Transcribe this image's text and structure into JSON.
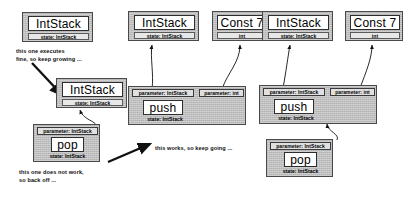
{
  "diagram": {
    "colors": {
      "plate": "#bdbdbd",
      "label_bg": "#ffffff",
      "ink": "#000000"
    },
    "labels": {
      "int_stack": "IntStack",
      "const7": "Const 7",
      "push": "push",
      "pop": "pop",
      "state_intstack": "state: IntStack",
      "int": "int",
      "param_intstack": "parameter: IntStack",
      "param_int": "parameter: int"
    },
    "notes": {
      "note_grow": "this one executes\nfine, so keep growing ...",
      "note_backoff": "this one does not work,\nso back off ...",
      "note_works": "this works, so keep going ..."
    },
    "stages": [
      {
        "id": "stage-1",
        "nodes": [
          {
            "id": "s1-intstack-top",
            "type": "IntStack",
            "state": "state: IntStack"
          },
          {
            "id": "s1-intstack-mid",
            "type": "IntStack",
            "state": "state: IntStack"
          },
          {
            "id": "s1-pop",
            "type": "pop",
            "state": "state: IntStack",
            "params": [
              "parameter: IntStack"
            ]
          }
        ]
      },
      {
        "id": "stage-2",
        "nodes": [
          {
            "id": "s2-intstack",
            "type": "IntStack",
            "state": "state: IntStack"
          },
          {
            "id": "s2-const7",
            "type": "Const 7",
            "state": "int"
          },
          {
            "id": "s2-push",
            "type": "push",
            "state": "state: IntStack",
            "params": [
              "parameter: IntStack",
              "parameter: int"
            ]
          }
        ]
      },
      {
        "id": "stage-3",
        "nodes": [
          {
            "id": "s3-intstack",
            "type": "IntStack",
            "state": "state: IntStack"
          },
          {
            "id": "s3-const7",
            "type": "Const 7",
            "state": "int"
          },
          {
            "id": "s3-push",
            "type": "push",
            "state": "state: IntStack",
            "params": [
              "parameter: IntStack",
              "parameter: int"
            ]
          },
          {
            "id": "s3-pop",
            "type": "pop",
            "state": "state: IntStack",
            "params": [
              "parameter: IntStack"
            ]
          }
        ]
      }
    ]
  }
}
